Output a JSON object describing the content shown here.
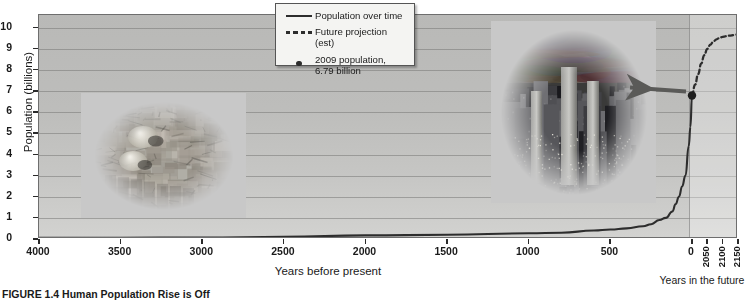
{
  "chart_data": {
    "type": "line",
    "title": "",
    "xlabel": "Years before present",
    "ylabel": "Population (billions)",
    "ylim": [
      0,
      10.6
    ],
    "xlim": [
      4000,
      -150
    ],
    "grid": true,
    "y_ticks": [
      0,
      1,
      2,
      3,
      4,
      5,
      6,
      7,
      8,
      9,
      10
    ],
    "x_ticks_past": [
      4000,
      3500,
      3000,
      2500,
      2000,
      1500,
      1000,
      500,
      0
    ],
    "x_ticks_future": [
      2050,
      2100,
      2150
    ],
    "future_axis_label": "Years in the future",
    "legend_position": "top-center",
    "series": [
      {
        "name": "Population over time",
        "style": "solid",
        "x": [
          4000,
          3500,
          3000,
          2500,
          2000,
          1500,
          1000,
          800,
          600,
          500,
          400,
          300,
          250,
          200,
          160,
          120,
          100,
          80,
          60,
          40,
          20,
          10,
          0
        ],
        "values": [
          0.05,
          0.06,
          0.07,
          0.1,
          0.17,
          0.2,
          0.27,
          0.3,
          0.4,
          0.45,
          0.5,
          0.6,
          0.7,
          0.9,
          1.0,
          1.3,
          1.65,
          2.0,
          2.5,
          3.0,
          4.4,
          5.3,
          6.79
        ]
      },
      {
        "name": "Future projection (est)",
        "style": "dashed",
        "x": [
          0,
          -10,
          -20,
          -30,
          -40,
          -50,
          -60,
          -70,
          -80,
          -90,
          -100,
          -120,
          -140,
          -150
        ],
        "values": [
          6.79,
          7.3,
          7.8,
          8.3,
          8.7,
          9.0,
          9.2,
          9.35,
          9.45,
          9.52,
          9.57,
          9.62,
          9.66,
          9.68
        ]
      }
    ],
    "points": [
      {
        "name": "2009 population",
        "x": 0,
        "y": 6.79,
        "label": "2009 population, 6.79 billion"
      }
    ],
    "annotations": [
      {
        "name": "industrial-era",
        "text": "Industrial Era",
        "orientation": "vertical"
      },
      {
        "name": "arrow-to-2009-point",
        "direction": "left"
      }
    ]
  },
  "legend": {
    "items": [
      {
        "key": "solid-line",
        "label": "Population over time"
      },
      {
        "key": "dashed-line",
        "label": "Future projection (est)"
      },
      {
        "key": "dot",
        "label": "2009 population,",
        "label2": "6.79 billion"
      }
    ]
  },
  "axes": {
    "y_title": "Population (billions)",
    "y_labels": [
      "10",
      "9",
      "8",
      "7",
      "6",
      "5",
      "4",
      "3",
      "2",
      "1",
      "0"
    ],
    "x_title": "Years before present",
    "x_labels": [
      "4000",
      "3500",
      "3000",
      "2500",
      "2000",
      "1500",
      "1000",
      "500",
      "0"
    ],
    "future_labels": [
      "2050",
      "2100",
      "2150"
    ],
    "future_title": "Years in the future"
  },
  "annotations": {
    "industrial_era": "Industrial Era"
  },
  "caption": {
    "figure_number": "FIGURE 1.4",
    "text": "Human Population Rise is Off"
  },
  "photos": {
    "ancient": "ancient-village-photo",
    "modern": "modern-city-skyline-photo"
  },
  "colors": {
    "plot_bg": "#bdbdbb",
    "line": "#2d2d2d",
    "grid": "#787876",
    "text": "#1a1a1a"
  }
}
